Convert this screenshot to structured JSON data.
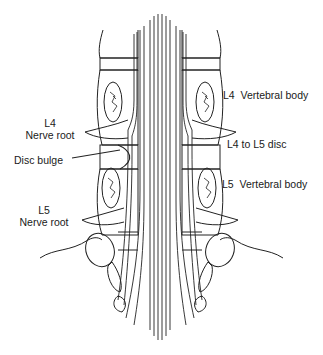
{
  "diagram": {
    "labels": {
      "l4_nerve_root": {
        "line1": "L4",
        "line2": "Nerve root"
      },
      "disc_bulge": "Disc bulge",
      "l5_nerve_root": {
        "line1": "L5",
        "line2": "Nerve root"
      },
      "l4_vertebral_body": "L4  Vertebral body",
      "l4_l5_disc": "L4 to L5 disc",
      "l5_vertebral_body": "L5  Vertebral body"
    },
    "colors": {
      "ink": "#1a1a1a",
      "background": "#ffffff"
    }
  }
}
